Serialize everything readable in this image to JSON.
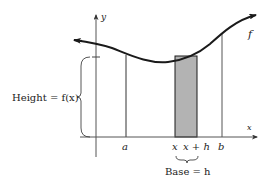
{
  "figure": {
    "type": "riemann-rectangle-diagram",
    "axes": {
      "x_label": "x",
      "y_label": "y"
    },
    "curve_label": "f",
    "ticks": {
      "a": "a",
      "x": "x",
      "x_plus_h": "x + h",
      "b": "b"
    },
    "height_label": "Height = f(x)",
    "base_label": "Base = h",
    "colors": {
      "stroke": "#1a1a1a",
      "rect_fill": "#b3b3b3",
      "guide_lines": "#555555",
      "background": "#ffffff"
    }
  }
}
